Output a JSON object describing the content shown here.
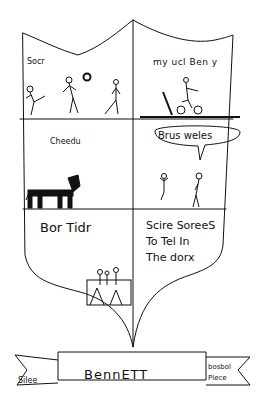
{
  "drawing": {
    "type": "hand-drawn coat of arms shield",
    "panels": [
      {
        "position": "top-left",
        "label": "Socr",
        "picture": "three stick figures playing soccer with a ball"
      },
      {
        "position": "top-right",
        "label": "my ucl Ben y",
        "picture": "stick figure on a bicycle"
      },
      {
        "position": "middle-left",
        "label": "Cheedu",
        "picture": "striped cheetah"
      },
      {
        "position": "middle-right",
        "label": "Brus weles",
        "picture": "speech bubble over two stick figures"
      },
      {
        "position": "bottom-left",
        "label": "Bor Tidr",
        "picture": "figures in a box"
      },
      {
        "position": "bottom-right",
        "label": "Scire Sorees To Tel In The dorx",
        "lines": [
          "Scire SoreeS",
          "To Tel In",
          "The dorx"
        ]
      }
    ],
    "banner": {
      "center": "BennETT",
      "left": "Silee",
      "right_lines": [
        "bosbol",
        "Plece"
      ]
    }
  }
}
